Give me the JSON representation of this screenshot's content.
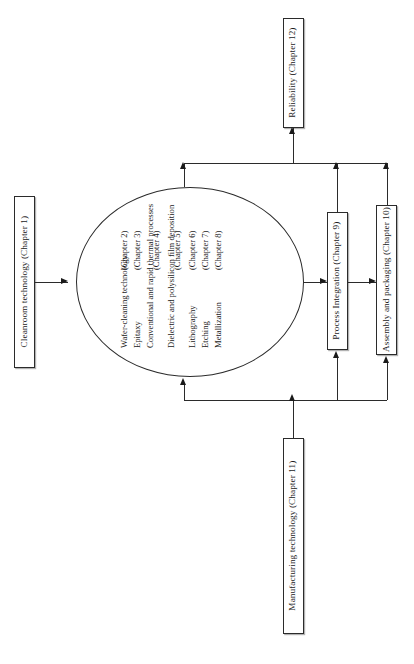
{
  "figure": {
    "caption": "",
    "orientation": "rotated-90-ccw",
    "background": "#ffffff",
    "line_color": "#2b2b2b"
  },
  "boxes": {
    "cleanroom": {
      "label": "Cleanroom technology (Chapter 1)"
    },
    "reliability": {
      "label": "Reliability (Chapter 12)"
    },
    "process_integration": {
      "label": "Process Integration (Chapter 9)"
    },
    "assembly": {
      "label": "Assembly and packaging (Chapter 10)"
    },
    "manufacturing": {
      "label": "Manufacturing technology (Chapter 11)"
    }
  },
  "ellipse": {
    "processes": [
      {
        "name_line1": "Wafer-cleaning",
        "name_line2": "technology",
        "chapter": "(Chapter 2)"
      },
      {
        "name_line1": "Epitaxy",
        "name_line2": "",
        "chapter": "(Chapter 3)"
      },
      {
        "name_line1": "Conventional and rapid",
        "name_line2": "thermal processes",
        "chapter": "(Chapter 4)"
      },
      {
        "name_line1": "Dielectric and polysilicon",
        "name_line2": "film deposition",
        "chapter": "(Chapter 5)"
      },
      {
        "name_line1": "Lithography",
        "name_line2": "",
        "chapter": "(Chapter 6)"
      },
      {
        "name_line1": "Etching",
        "name_line2": "",
        "chapter": "(Chapter 7)"
      },
      {
        "name_line1": "Metallization",
        "name_line2": "",
        "chapter": "(Chapter 8)"
      }
    ]
  }
}
